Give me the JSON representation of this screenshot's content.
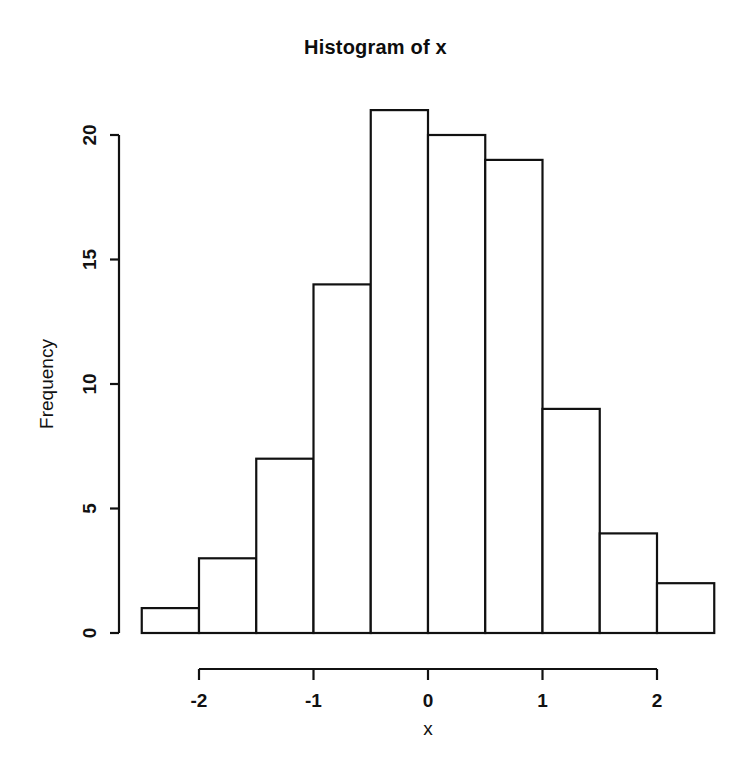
{
  "chart_data": {
    "type": "bar",
    "title": "Histogram of x",
    "xlabel": "x",
    "ylabel": "Frequency",
    "categories": [
      "-2.5 to -2",
      "-2 to -1.5",
      "-1.5 to -1",
      "-1 to -0.5",
      "-0.5 to 0",
      "0 to 0.5",
      "0.5 to 1",
      "1 to 1.5",
      "1.5 to 2",
      "2 to 2.5"
    ],
    "bin_edges": [
      -2.5,
      -2,
      -1.5,
      -1,
      -0.5,
      0,
      0.5,
      1,
      1.5,
      2,
      2.5
    ],
    "values": [
      1,
      3,
      7,
      14,
      21,
      20,
      19,
      9,
      4,
      2
    ],
    "bin_width": 0.5,
    "xlim": [
      -2.5,
      2.5
    ],
    "ylim": [
      0,
      21
    ],
    "x_ticks": [
      -2,
      -1,
      0,
      1,
      2
    ],
    "x_tick_labels": [
      "-2",
      "-1",
      "0",
      "1",
      "2"
    ],
    "y_ticks": [
      0,
      5,
      10,
      15,
      20
    ],
    "y_tick_labels": [
      "0",
      "5",
      "10",
      "15",
      "20"
    ],
    "grid": false,
    "legend": false,
    "bar_fill_color": "#ffffff",
    "bar_border_color": "#111111",
    "background_color": "#ffffff"
  }
}
